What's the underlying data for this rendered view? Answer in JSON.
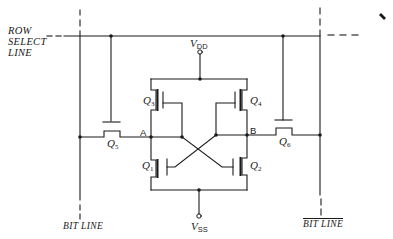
{
  "diagram": {
    "row_select_label": [
      "ROW",
      "SELECT",
      "LINE"
    ],
    "supply_top": {
      "symbol": "V",
      "subscript": "DD"
    },
    "supply_bottom": {
      "symbol": "V",
      "subscript": "SS"
    },
    "nodes": {
      "left": "A",
      "right": "B"
    },
    "transistors": [
      {
        "id": "Q1",
        "symbol": "Q",
        "subscript": "1"
      },
      {
        "id": "Q2",
        "symbol": "Q",
        "subscript": "2"
      },
      {
        "id": "Q3",
        "symbol": "Q",
        "subscript": "3"
      },
      {
        "id": "Q4",
        "symbol": "Q",
        "subscript": "4"
      },
      {
        "id": "Q5",
        "symbol": "Q",
        "subscript": "5"
      },
      {
        "id": "Q6",
        "symbol": "Q",
        "subscript": "6"
      }
    ],
    "bit_line_left": "BIT LINE",
    "bit_line_right": "BIT LINE",
    "bit_line_right_overbar": true,
    "colors": {
      "ink": "#1a1a1a",
      "background": "#ffffff"
    }
  }
}
